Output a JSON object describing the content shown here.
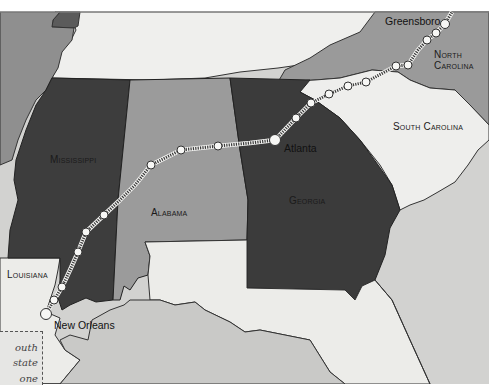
{
  "map": {
    "title": "Crescent route: New Orleans to Greensboro",
    "colors": {
      "background_top": "#ffffff",
      "frame": "#9a9a9a",
      "tennessee": "#efefed",
      "arkansas": "#8f8f8f",
      "mississippi": "#3d3d3d",
      "alabama": "#9b9b9b",
      "georgia": "#3b3b3b",
      "north_carolina": "#9a9a9a",
      "south_carolina": "#eeeeec",
      "louisiana": "#ecece9",
      "florida": "#ecece9",
      "gulf": "#c9c9c7",
      "atlantic": "#d2d2d0",
      "route": "#444444",
      "station": "#f7f7f5"
    },
    "states": [
      {
        "id": "mississippi",
        "label": "Mississippi"
      },
      {
        "id": "alabama",
        "label": "Alabama"
      },
      {
        "id": "georgia",
        "label": "Georgia"
      },
      {
        "id": "south_carolina",
        "label": "South Carolina"
      },
      {
        "id": "north_carolina",
        "label_line1": "North",
        "label_line2": "Carolina"
      },
      {
        "id": "louisiana",
        "label": "Louisiana"
      }
    ],
    "cities": [
      {
        "id": "greensboro",
        "label": "Greensboro"
      },
      {
        "id": "atlanta",
        "label": "Atlanta"
      },
      {
        "id": "new_orleans",
        "label": "New Orleans"
      }
    ],
    "stations": [
      {
        "x": 46,
        "y": 314,
        "major": true
      },
      {
        "x": 54,
        "y": 300
      },
      {
        "x": 62,
        "y": 287
      },
      {
        "x": 78,
        "y": 252
      },
      {
        "x": 86,
        "y": 232
      },
      {
        "x": 104,
        "y": 215
      },
      {
        "x": 151,
        "y": 165
      },
      {
        "x": 181,
        "y": 150
      },
      {
        "x": 218,
        "y": 146
      },
      {
        "x": 275,
        "y": 140,
        "major": true
      },
      {
        "x": 296,
        "y": 118
      },
      {
        "x": 311,
        "y": 103
      },
      {
        "x": 329,
        "y": 94
      },
      {
        "x": 348,
        "y": 86
      },
      {
        "x": 366,
        "y": 82
      },
      {
        "x": 396,
        "y": 66
      },
      {
        "x": 408,
        "y": 65
      },
      {
        "x": 427,
        "y": 40
      },
      {
        "x": 436,
        "y": 33
      },
      {
        "x": 445,
        "y": 24,
        "major": true
      }
    ],
    "note": {
      "line1": "outh",
      "line2": "state",
      "line3": "one"
    }
  }
}
